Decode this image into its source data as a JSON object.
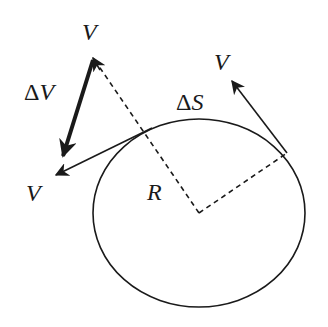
{
  "diagram": {
    "title": "",
    "labels": {
      "v_top": "V",
      "v_right": "V",
      "v_left": "V",
      "delta_v_symbol": "Δ",
      "delta_v_var": "V",
      "delta_s_symbol": "Δ",
      "delta_s_var": "S",
      "radius": "R"
    },
    "colors": {
      "stroke": "#1a1a1a",
      "background": "#ffffff"
    },
    "geometry": {
      "circle": {
        "cx": 199,
        "cy": 213,
        "rx": 106,
        "ry": 94
      },
      "center": [
        199,
        213
      ],
      "tangent_point_right": [
        287,
        153
      ],
      "tangent_point_left": [
        152,
        128
      ],
      "velocity_right_tip": [
        230,
        80
      ],
      "velocity_left_tip": [
        55,
        175
      ],
      "velocity_top_tip": [
        93,
        58
      ],
      "delta_v_tip": [
        62,
        158
      ]
    }
  }
}
